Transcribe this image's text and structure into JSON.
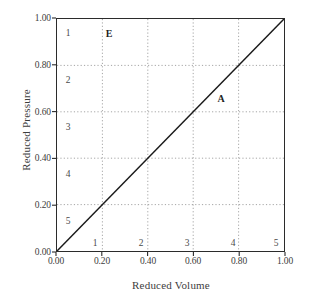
{
  "chart_data": {
    "type": "line",
    "title": "",
    "xlabel": "Reduced Volume",
    "ylabel": "Reduced Pressure",
    "xlim": [
      0.0,
      1.0
    ],
    "ylim": [
      0.0,
      1.0
    ],
    "grid": true,
    "grid_style": "dotted",
    "legend": "none",
    "xticks": [
      "0.00",
      "0.20",
      "0.40",
      "0.60",
      "0.80",
      "1.00"
    ],
    "xtick_values": [
      0.0,
      0.2,
      0.4,
      0.6,
      0.8,
      1.0
    ],
    "yticks": [
      "0.00",
      "0.20",
      "0.40",
      "0.60",
      "0.80",
      "1.00"
    ],
    "ytick_values": [
      0.0,
      0.2,
      0.4,
      0.6,
      0.8,
      1.0
    ],
    "series": [
      {
        "name": "A",
        "x": [
          0.0,
          1.0
        ],
        "y": [
          0.0,
          1.0
        ],
        "color": "#1a1a1a",
        "style": "solid"
      }
    ],
    "annotations": [
      {
        "text": "E",
        "x": 0.225,
        "y": 0.935,
        "bold": true
      },
      {
        "text": "A",
        "x": 0.715,
        "y": 0.655,
        "bold": true
      }
    ],
    "row_numbers": [
      {
        "text": "1",
        "x": 0.035,
        "y": 0.935
      },
      {
        "text": "2",
        "x": 0.035,
        "y": 0.735
      },
      {
        "text": "3",
        "x": 0.035,
        "y": 0.535
      },
      {
        "text": "4",
        "x": 0.035,
        "y": 0.335
      },
      {
        "text": "5",
        "x": 0.035,
        "y": 0.135
      }
    ],
    "column_numbers": [
      {
        "text": "1",
        "x": 0.165,
        "y": 0.045
      },
      {
        "text": "2",
        "x": 0.365,
        "y": 0.045
      },
      {
        "text": "3",
        "x": 0.565,
        "y": 0.045
      },
      {
        "text": "4",
        "x": 0.765,
        "y": 0.045
      },
      {
        "text": "5",
        "x": 0.955,
        "y": 0.045
      }
    ],
    "colors": {
      "line": "#1a1a1a",
      "frame": "#2b2b2b",
      "grid": "#9a9a9a",
      "text": "#3d3d3d"
    }
  }
}
